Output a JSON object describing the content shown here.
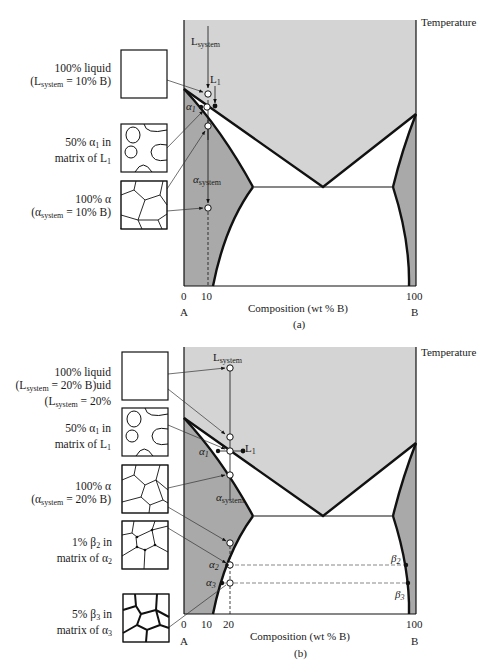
{
  "figure": {
    "panels": [
      {
        "id": "a",
        "caption": "(a)",
        "axis_label_x": "Composition (wt % B)",
        "axis_label_y": "Temperature",
        "ticks": [
          "0",
          "10",
          "100"
        ],
        "end_labels": {
          "left": "A",
          "right": "B"
        },
        "point_labels": {
          "L_system": "L",
          "L_system_sub": "system",
          "L1": "L",
          "L1_sub": "1",
          "alpha1": "α",
          "alpha1_sub": "1",
          "alpha_system": "α",
          "alpha_system_sub": "system"
        },
        "micrographs": [
          {
            "name": "liquid",
            "line1": "100% liquid",
            "line2_pre": "(L",
            "line2_sub": "system",
            "line2_post": " = 10% B)"
          },
          {
            "name": "alpha-in-liquid",
            "line1_pre": "50% α",
            "line1_sub": "1",
            "line1_post": " in",
            "line2_pre": "matrix of L",
            "line2_sub": "1"
          },
          {
            "name": "full-alpha",
            "line1": "100% α",
            "line2_pre": "(α",
            "line2_sub": "system",
            "line2_post": " = 10% B)"
          }
        ]
      },
      {
        "id": "b",
        "caption": "(b)",
        "axis_label_x": "Composition (wt % B)",
        "axis_label_y": "Temperature",
        "ticks": [
          "0",
          "10",
          "20",
          "100"
        ],
        "end_labels": {
          "left": "A",
          "right": "B"
        },
        "point_labels": {
          "L_system": "L",
          "L_system_sub": "system",
          "L1": "L",
          "L1_sub": "1",
          "alpha1": "α",
          "alpha1_sub": "1",
          "alpha_system": "α",
          "alpha_system_sub": "system",
          "alpha2": "α",
          "alpha2_sub": "2",
          "alpha3": "α",
          "alpha3_sub": "3",
          "beta2": "β",
          "beta2_sub": "2",
          "beta3": "β",
          "beta3_sub": "3"
        },
        "micrographs": [
          {
            "name": "liquid",
            "line1": "100% liquid",
            "line2_pre": "(L",
            "line2_sub": "system",
            "line2_post": " = 20% B)uid",
            "line3_pre": "(L",
            "line3_sub": "system",
            "line3_post": " = 20%"
          },
          {
            "name": "alpha-in-liquid",
            "line1_pre": "50% α",
            "line1_sub": "1",
            "line1_post": " in",
            "line2_pre": "matrix of L",
            "line2_sub": "1"
          },
          {
            "name": "full-alpha",
            "line1": "100% α",
            "line2_pre": "(α",
            "line2_sub": "system",
            "line2_post": " = 20% B)"
          },
          {
            "name": "beta2-in-alpha2",
            "line1_pre": "1% β",
            "line1_sub": "2",
            "line1_post": " in",
            "line2_pre": "matrix of α",
            "line2_sub": "2"
          },
          {
            "name": "beta3-in-alpha3",
            "line1_pre": "5% β",
            "line1_sub": "3",
            "line1_post": " in",
            "line2_pre": "matrix of α",
            "line2_sub": "3"
          }
        ]
      }
    ],
    "colors": {
      "liquid_region": "#d4d4d4",
      "solid_solution_region": "#a9a9a9",
      "two_phase_region": "#ffffff",
      "lines": "#111111"
    }
  }
}
